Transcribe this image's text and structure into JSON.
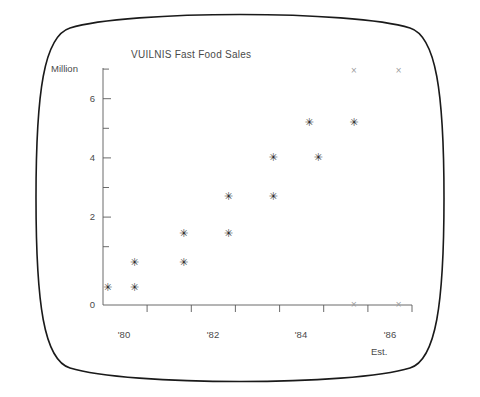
{
  "screen": {
    "bezel_name": "crt-screen-bezel",
    "background": "#ffffff",
    "border_color": "#1a1a1a"
  },
  "chart_data": {
    "type": "scatter",
    "title": "VUILNIS Fast Food Sales",
    "xlabel": "",
    "ylabel": "Million",
    "ylim": [
      0,
      7.2
    ],
    "xlim": [
      1979.5,
      1986.4
    ],
    "grid": false,
    "legend_position": "none",
    "annotations": [
      {
        "name": "est-note",
        "text": "Est.",
        "x": 1986.0,
        "y": -1.1
      }
    ],
    "y_ticks_major": [
      0,
      2,
      4,
      6
    ],
    "y_tick_labels": [
      "0",
      "2",
      "4",
      "6"
    ],
    "y_ticks_minor": [
      1,
      3,
      5,
      7
    ],
    "x_ticks": [
      1980,
      1981,
      1982,
      1983,
      1984,
      1985,
      1986
    ],
    "x_tick_labels": [
      "'80",
      "",
      "'82",
      "",
      "'84",
      "",
      "'86"
    ],
    "x_tick_labels_shown": [
      "'80",
      "'82",
      "'84",
      "'86"
    ],
    "series": [
      {
        "name": "Actual Sales",
        "marker": "asterisk",
        "color": "#2b2b2b",
        "points": [
          {
            "x": 1979.6,
            "y": 0.55
          },
          {
            "x": 1980.2,
            "y": 1.3
          },
          {
            "x": 1980.2,
            "y": 0.55
          },
          {
            "x": 1981.3,
            "y": 2.2
          },
          {
            "x": 1981.3,
            "y": 1.3
          },
          {
            "x": 1982.3,
            "y": 3.3
          },
          {
            "x": 1982.3,
            "y": 2.2
          },
          {
            "x": 1983.3,
            "y": 4.5
          },
          {
            "x": 1983.3,
            "y": 3.3
          },
          {
            "x": 1984.1,
            "y": 5.55
          },
          {
            "x": 1984.3,
            "y": 4.5
          },
          {
            "x": 1985.1,
            "y": 5.55
          }
        ]
      },
      {
        "name": "Estimated Sales",
        "marker": "x",
        "color": "#9a9a9a",
        "points": [
          {
            "x": 1985.1,
            "y": 7.1
          },
          {
            "x": 1986.1,
            "y": 7.1
          },
          {
            "x": 1985.1,
            "y": 0.0
          },
          {
            "x": 1986.1,
            "y": 0.0
          }
        ]
      }
    ]
  },
  "axis_geometry": {
    "x_origin_px": 103,
    "x_end_px": 412,
    "y_zero_px": 305,
    "y_top_px": 68,
    "x_units_per_px": 0.02233,
    "y_value_at_top": 7.2
  }
}
